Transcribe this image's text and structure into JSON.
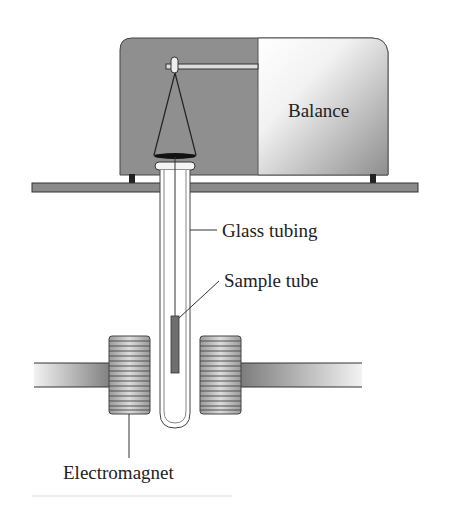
{
  "diagram": {
    "labels": {
      "balance": "Balance",
      "glass_tubing": "Glass tubing",
      "sample_tube": "Sample tube",
      "electromagnet": "Electromagnet"
    },
    "colors": {
      "housing": "#8f8f8f",
      "balance_light": "#f4f4f4",
      "shelf": "#8a8a8a",
      "magnet_core_dark": "#6a6a6a",
      "coil": "#b9b9b9",
      "sample": "#6e6e6e",
      "outline": "#333333"
    }
  }
}
